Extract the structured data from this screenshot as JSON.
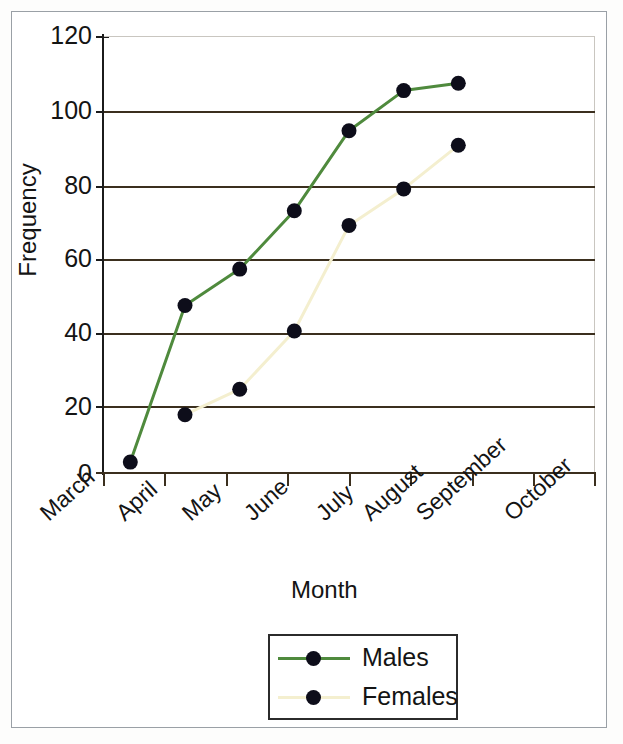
{
  "figure": {
    "background": "#ffffff",
    "frame_color": "#9aa0a6"
  },
  "chart_data": {
    "type": "line",
    "title": "",
    "subtitle": "",
    "xlabel": "Month",
    "ylabel": "Frequency",
    "categories": [
      "March",
      "April",
      "May",
      "June",
      "July",
      "August",
      "September",
      "October"
    ],
    "ylim": [
      0,
      120
    ],
    "ytick_labels": [
      "0",
      "20",
      "40",
      "60",
      "80",
      "100",
      "120"
    ],
    "ytick_values": [
      0,
      20,
      40,
      60,
      80,
      100,
      120
    ],
    "grid": "horizontal",
    "legend_position": "bottom-center",
    "markers": "filled-circle",
    "marker_color": "#0d0d1a",
    "series": [
      {
        "name": "Males",
        "color": "#4f8a3d",
        "values": [
          3,
          46,
          56,
          72,
          94,
          105,
          107,
          null
        ]
      },
      {
        "name": "Females",
        "color": "#f4efcf",
        "values": [
          null,
          16,
          23,
          39,
          68,
          78,
          90,
          null
        ]
      }
    ]
  },
  "axes": {
    "y_labels": [
      "120",
      "100",
      "80",
      "60",
      "40",
      "20",
      "0"
    ],
    "x_labels": [
      "March",
      "April",
      "May",
      "June",
      "July",
      "August",
      "September",
      "October"
    ],
    "x_title": "Month",
    "y_title": "Frequency"
  },
  "legend": {
    "items": [
      {
        "label": "Males",
        "color": "#4f8a3d",
        "marker": "dot-marker"
      },
      {
        "label": "Females",
        "color": "#f4efcf",
        "marker": "dot-marker"
      }
    ]
  }
}
